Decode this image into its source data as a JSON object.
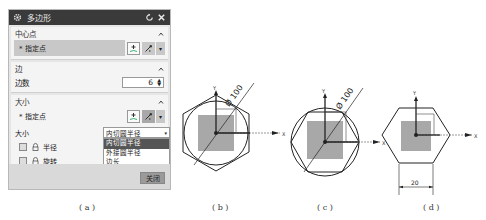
{
  "dialog": {
    "title": "多边形",
    "icons": {
      "gear": "gear-icon",
      "reset": "reset-icon",
      "close": "close-icon"
    },
    "sections": {
      "center": {
        "header": "中心点",
        "point_label": "* 指定点"
      },
      "sides": {
        "header": "边",
        "count_label": "边数",
        "count_value": "6"
      },
      "size": {
        "header": "大小",
        "point_label": "* 指定点",
        "size_label": "大小",
        "select_value": "内切圆半径",
        "options": [
          "内切圆半径",
          "外接圆半径",
          "边长"
        ],
        "selected_index": 0,
        "radius_label": "半径",
        "rotation_label": "旋转"
      }
    },
    "close_button": "关闭"
  },
  "figures": {
    "a": {
      "caption": "( a )"
    },
    "b": {
      "caption": "( b )",
      "dimension": "Ø 100",
      "axis_x": "X",
      "axis_y": "Y"
    },
    "c": {
      "caption": "( c )",
      "dimension": "Ø 100",
      "axis_x": "X",
      "axis_y": "Y"
    },
    "d": {
      "caption": "( d )",
      "dimension": "20",
      "axis_x": "X",
      "axis_y": "Y"
    }
  }
}
